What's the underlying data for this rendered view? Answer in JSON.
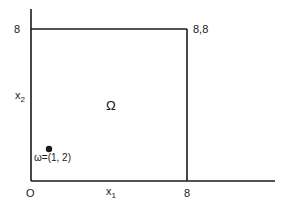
{
  "diagram": {
    "type": "domain-plot",
    "axes": {
      "x_label": "x",
      "x_label_sub": "1",
      "y_label": "x",
      "y_label_sub": "2",
      "origin_label": "O",
      "x_tick_label": "8",
      "y_tick_label": "8"
    },
    "region": {
      "label": "Ω",
      "corner_label": "8,8",
      "bounds": {
        "x_min": 0,
        "x_max": 8,
        "y_min": 0,
        "y_max": 8
      }
    },
    "point": {
      "label": "ω=(1, 2)",
      "x": 1,
      "y": 2
    },
    "colors": {
      "line": "#1a1a1a",
      "background": "#ffffff"
    }
  }
}
